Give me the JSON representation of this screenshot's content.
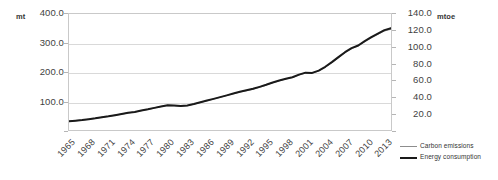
{
  "axes": {
    "left_unit": "mt",
    "right_unit": "mtoe",
    "left_ticks": [
      "400.0",
      "300.0",
      "200.0",
      "100.0"
    ],
    "right_ticks": [
      "140.0",
      "120.0",
      "100.0",
      "80.0",
      "60.0",
      "40.0",
      "20.0"
    ]
  },
  "legend": {
    "items": [
      {
        "label": "Carbon emissions",
        "color": "#8d8d8d"
      },
      {
        "label": "Energy consumption",
        "color": "#1a1a1a"
      }
    ]
  },
  "chart_data": {
    "type": "line",
    "title": "",
    "xlabel": "",
    "ylabel": "mt",
    "y2label": "mtoe",
    "grid": true,
    "legend_position": "bottom-right",
    "ylim": [
      0,
      400
    ],
    "y2lim": [
      0,
      140
    ],
    "xlim": [
      1965,
      2014
    ],
    "tick_labels": [
      "1965",
      "1968",
      "1971",
      "1974",
      "1977",
      "1980",
      "1983",
      "1986",
      "1989",
      "1992",
      "1995",
      "1998",
      "2001",
      "2004",
      "2007",
      "2010",
      "2013"
    ],
    "x": [
      1965,
      1966,
      1967,
      1968,
      1969,
      1970,
      1971,
      1972,
      1973,
      1974,
      1975,
      1976,
      1977,
      1978,
      1979,
      1980,
      1981,
      1982,
      1983,
      1984,
      1985,
      1986,
      1987,
      1988,
      1989,
      1990,
      1991,
      1992,
      1993,
      1994,
      1995,
      1996,
      1997,
      1998,
      1999,
      2000,
      2001,
      2002,
      2003,
      2004,
      2005,
      2006,
      2007,
      2008,
      2009,
      2010,
      2011,
      2012,
      2013,
      2014
    ],
    "series": [
      {
        "name": "Carbon emissions",
        "unit": "mt",
        "axis": "left",
        "color": "#8d8d8d",
        "width": 1.2,
        "values": [
          30,
          32,
          34,
          37,
          40,
          44,
          47,
          51,
          55,
          59,
          62,
          67,
          71,
          76,
          81,
          85,
          84,
          82,
          84,
          89,
          95,
          101,
          107,
          113,
          119,
          125,
          131,
          136,
          141,
          148,
          155,
          163,
          170,
          176,
          181,
          190,
          197,
          196,
          204,
          217,
          233,
          250,
          267,
          281,
          290,
          305,
          318,
          330,
          342,
          348
        ]
      },
      {
        "name": "Energy consumption",
        "unit": "mtoe",
        "axis": "right",
        "color": "#1a1a1a",
        "width": 2.0,
        "values": [
          10.6,
          11.3,
          12.0,
          13.0,
          14.1,
          15.5,
          16.6,
          17.9,
          19.3,
          20.7,
          21.8,
          23.5,
          25.0,
          26.7,
          28.4,
          29.9,
          29.5,
          28.9,
          29.6,
          31.3,
          33.4,
          35.5,
          37.6,
          39.7,
          41.8,
          44.0,
          46.1,
          47.9,
          49.7,
          52.1,
          54.6,
          57.4,
          59.8,
          61.9,
          63.6,
          66.8,
          69.2,
          68.9,
          71.7,
          76.3,
          81.9,
          87.9,
          93.9,
          98.8,
          102.0,
          107.3,
          112.0,
          116.2,
          120.5,
          123.0
        ]
      }
    ]
  }
}
